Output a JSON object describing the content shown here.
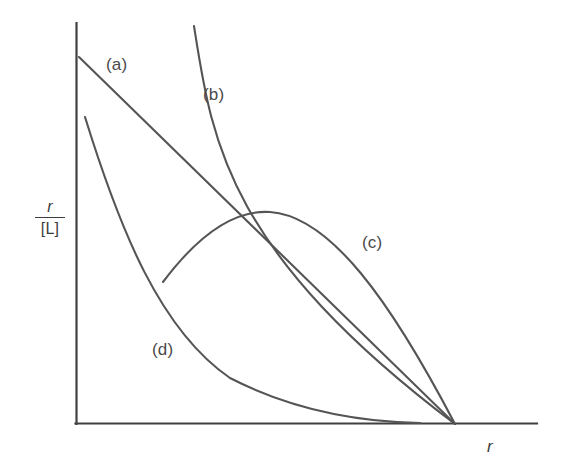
{
  "figure": {
    "background_color": "#ffffff",
    "axis_color": "#404040",
    "curve_color": "#555555",
    "label_color": "#4a4a4a"
  },
  "axes": {
    "y_label_numerator": "r",
    "y_label_denominator": "[L]",
    "x_label": "r",
    "origin_px": [
      76,
      424
    ],
    "y_axis_top_px": [
      76,
      23
    ],
    "x_axis_right_px": [
      537,
      424
    ],
    "convergence_px": [
      455,
      424
    ]
  },
  "chart_data": {
    "type": "line",
    "title": "",
    "xlabel": "r",
    "ylabel": "r/[L]",
    "grid": false,
    "legend": "inline-labels",
    "xlim": [
      0,
      1
    ],
    "ylim": [
      0,
      1
    ],
    "annotations": [
      {
        "text": "(a)",
        "x_px": 106,
        "y_px": 55
      },
      {
        "text": "(b)",
        "x_px": 203,
        "y_px": 85
      },
      {
        "text": "(c)",
        "x_px": 362,
        "y_px": 233
      },
      {
        "text": "(d)",
        "x_px": 152,
        "y_px": 340
      }
    ],
    "series": [
      {
        "name": "(a)",
        "label": "(a)",
        "shape": "straight-descending-line",
        "description": "Linear Scatchard plot: non-cooperative binding, identical independent sites",
        "path_px": "M 79 57 L 455 424",
        "points_px": [
          [
            79,
            57
          ],
          [
            172,
            148
          ],
          [
            265,
            239
          ],
          [
            360,
            331
          ],
          [
            455,
            424
          ]
        ]
      },
      {
        "name": "(b)",
        "label": "(b)",
        "shape": "convex-decreasing-curve",
        "description": "Downward (concave-up) curvature: negative cooperativity or heterogeneous sites",
        "path_px": "M 194 26 C 212 140, 225 250, 455 424",
        "points_px": [
          [
            194,
            26
          ],
          [
            207,
            120
          ],
          [
            217,
            200
          ],
          [
            240,
            290
          ],
          [
            300,
            355
          ],
          [
            380,
            398
          ],
          [
            455,
            424
          ]
        ]
      },
      {
        "name": "(c)",
        "label": "(c)",
        "shape": "concave-hump-curve",
        "description": "Curve with a maximum (hump): positive cooperativity",
        "path_px": "M 163 282 C 205 226, 240 210, 270 212 C 330 216, 390 300, 455 424",
        "points_px": [
          [
            163,
            282
          ],
          [
            200,
            238
          ],
          [
            235,
            215
          ],
          [
            270,
            212
          ],
          [
            310,
            228
          ],
          [
            355,
            272
          ],
          [
            405,
            340
          ],
          [
            455,
            424
          ]
        ]
      },
      {
        "name": "(d)",
        "label": "(d)",
        "shape": "steep-concave-decay",
        "description": "Strongly concave-up decaying curve approaching the r axis",
        "path_px": "M 85 117 C 120 230, 160 330, 230 378 C 300 414, 370 422, 420 423",
        "points_px": [
          [
            85,
            117
          ],
          [
            120,
            215
          ],
          [
            160,
            300
          ],
          [
            200,
            350
          ],
          [
            250,
            388
          ],
          [
            320,
            412
          ],
          [
            380,
            420
          ],
          [
            420,
            423
          ]
        ]
      }
    ]
  },
  "labels": {
    "a": "(a)",
    "b": "(b)",
    "c": "(c)",
    "d": "(d)"
  }
}
